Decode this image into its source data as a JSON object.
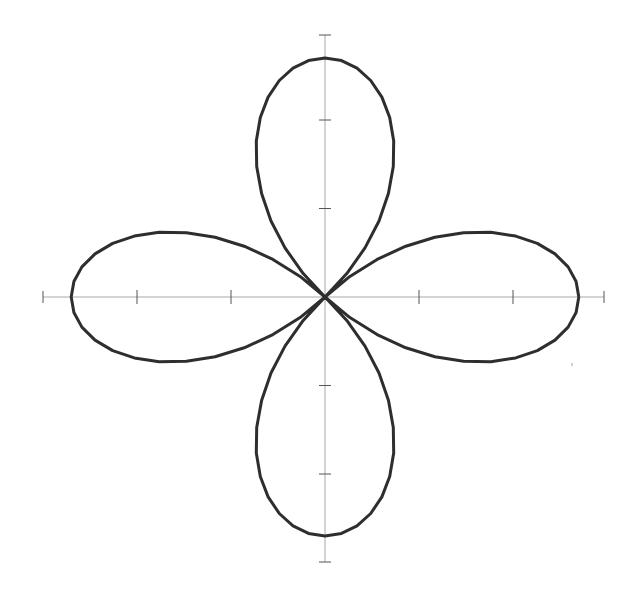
{
  "chart_data": {
    "type": "line",
    "title": "",
    "subtitle": "",
    "xlabel": "",
    "ylabel": "",
    "equation": "r = 2.7 * cos(2*theta)",
    "amplitude": 2.7,
    "petals": 4,
    "xlim": [
      -3,
      3
    ],
    "ylim": [
      -3,
      3
    ],
    "xticks": [
      -2,
      -1,
      1,
      2
    ],
    "yticks": [
      -2,
      -1,
      1,
      2
    ],
    "tick_labels_shown": false,
    "grid": false,
    "legend": null,
    "line_color": "#2e2e2e",
    "axis_color": "#a8a8a8",
    "samples": 96
  },
  "layout": {
    "origin_px": [
      325,
      297
    ],
    "x_px_per_unit": 94,
    "y_px_per_unit": 88.5,
    "x_axis_px": [
      43,
      604
    ],
    "y_axis_px": [
      35,
      562
    ]
  }
}
